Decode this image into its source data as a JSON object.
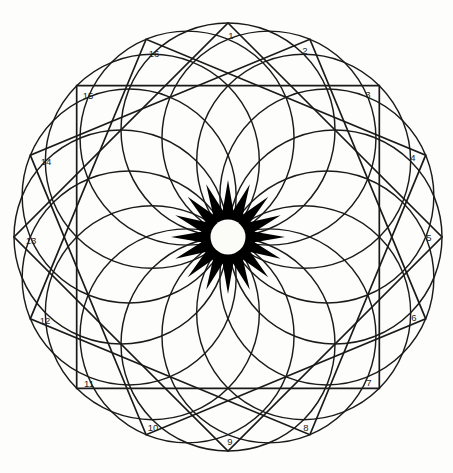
{
  "figure": {
    "type": "geometric-diagram",
    "canvas": {
      "width": 453,
      "height": 473,
      "background": "#fdfdfc"
    },
    "center": {
      "x": 228,
      "y": 237
    },
    "stroke_color": "#1a1a1a",
    "fill_color": "#000000",
    "hole_color": "#fbfbf7"
  },
  "chart_data": {
    "type": "diagram",
    "center": [
      228,
      237
    ],
    "point_count": 16,
    "outer_radius": 214,
    "circle_ring_radius": 107,
    "circle_radius": 107,
    "core_star_outer_radius": 57,
    "core_star_inner_radius": 27,
    "core_hole_radius": 17.5,
    "square_count": 4,
    "square_rotation_step_deg": 22.5,
    "label_radius": 196,
    "vertices": [
      {
        "n": "1",
        "angle_deg": 0,
        "x": 228,
        "y": 23
      },
      {
        "n": "2",
        "angle_deg": 22.5,
        "x": 310,
        "y": 40
      },
      {
        "n": "3",
        "angle_deg": 45,
        "x": 379,
        "y": 86
      },
      {
        "n": "4",
        "angle_deg": 67.5,
        "x": 425,
        "y": 155
      },
      {
        "n": "5",
        "angle_deg": 90,
        "x": 442,
        "y": 237
      },
      {
        "n": "6",
        "angle_deg": 112.5,
        "x": 425,
        "y": 319
      },
      {
        "n": "7",
        "angle_deg": 135,
        "x": 379,
        "y": 388
      },
      {
        "n": "8",
        "angle_deg": 157.5,
        "x": 310,
        "y": 434
      },
      {
        "n": "9",
        "angle_deg": 180,
        "x": 228,
        "y": 451
      },
      {
        "n": "10",
        "angle_deg": 202.5,
        "x": 146,
        "y": 434
      },
      {
        "n": "11",
        "angle_deg": 225,
        "x": 77,
        "y": 388
      },
      {
        "n": "12",
        "angle_deg": 247.5,
        "x": 31,
        "y": 319
      },
      {
        "n": "13",
        "angle_deg": 270,
        "x": 14,
        "y": 237
      },
      {
        "n": "14",
        "angle_deg": 292.5,
        "x": 31,
        "y": 155
      },
      {
        "n": "15",
        "angle_deg": 315,
        "x": 77,
        "y": 86
      },
      {
        "n": "16",
        "angle_deg": 337.5,
        "x": 146,
        "y": 40
      }
    ],
    "labels": [
      "1",
      "2",
      "3",
      "4",
      "5",
      "6",
      "7",
      "8",
      "9",
      "10",
      "11",
      "12",
      "13",
      "14",
      "15",
      "16"
    ],
    "label_offsets": [
      {
        "n": "1",
        "x": 231,
        "y": 36
      },
      {
        "n": "2",
        "x": 305,
        "y": 51
      },
      {
        "n": "3",
        "x": 368,
        "y": 95
      },
      {
        "n": "4",
        "x": 413,
        "y": 158
      },
      {
        "n": "5",
        "x": 429,
        "y": 238
      },
      {
        "n": "6",
        "x": 414,
        "y": 318
      },
      {
        "n": "7",
        "x": 369,
        "y": 383
      },
      {
        "n": "8",
        "x": 306,
        "y": 428
      },
      {
        "n": "9",
        "x": 230,
        "y": 442
      },
      {
        "n": "10",
        "x": 153,
        "y": 428
      },
      {
        "n": "11",
        "x": 89,
        "y": 384
      },
      {
        "n": "12",
        "x": 45,
        "y": 321
      },
      {
        "n": "13",
        "x": 31,
        "y": 241
      },
      {
        "n": "14",
        "x": 46,
        "y": 162
      },
      {
        "n": "15",
        "x": 88,
        "y": 96
      },
      {
        "n": "16",
        "x": 154,
        "y": 54
      }
    ]
  }
}
